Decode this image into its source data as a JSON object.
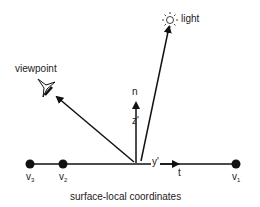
{
  "diagram": {
    "caption": "surface-local coordinates",
    "labels": {
      "light": "light",
      "viewpoint": "viewpoint",
      "normal": "n",
      "z_axis": "z'",
      "y_axis": "y'",
      "tangent": "t"
    },
    "vertices": [
      {
        "name": "v",
        "sub": "3"
      },
      {
        "name": "v",
        "sub": "2"
      },
      {
        "name": "v",
        "sub": "1"
      }
    ],
    "icons": {
      "light": "sun-icon",
      "viewpoint": "eye-icon"
    },
    "colors": {
      "stroke": "#111111",
      "text": "#222222",
      "background": "#ffffff"
    }
  }
}
